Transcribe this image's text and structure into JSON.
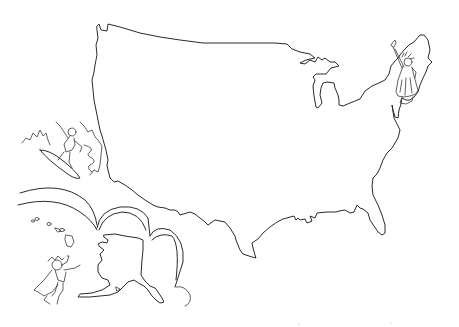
{
  "drawing": {
    "title": "Hand-drawn United States outline map",
    "background_color": "#ffffff",
    "ink_color": "#2a2a2a",
    "elements": [
      {
        "name": "contiguous-us-outline",
        "label": "Contiguous United States outline"
      },
      {
        "name": "statue-of-liberty",
        "label": "Statue of Liberty figure (Northeast)"
      },
      {
        "name": "surfer",
        "label": "Surfer riding a wave (West Coast)"
      },
      {
        "name": "rainbow-arcs",
        "label": "Scalloped cloud arcs"
      },
      {
        "name": "hawaii-islands",
        "label": "Hawaiian islands"
      },
      {
        "name": "alaska-outline",
        "label": "Alaska outline"
      },
      {
        "name": "flying-child",
        "label": "Child with cape flying"
      }
    ]
  }
}
